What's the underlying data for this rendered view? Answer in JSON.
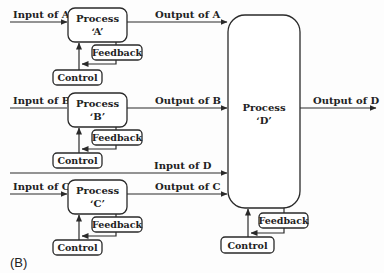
{
  "diagram": {
    "caption": "(B)",
    "processes": [
      {
        "id": "A",
        "title": "Process",
        "name": "‘A’",
        "input": "Input of A",
        "output": "Output of A",
        "feedback": "Feedback",
        "control": "Control"
      },
      {
        "id": "B",
        "title": "Process",
        "name": "‘B’",
        "input": "Input of B",
        "output": "Output of B",
        "feedback": "Feedback",
        "control": "Control"
      },
      {
        "id": "C",
        "title": "Process",
        "name": "‘C’",
        "input": "Input of C",
        "output": "Output of C",
        "feedback": "Feedback",
        "control": "Control"
      }
    ],
    "process_d": {
      "title": "Process",
      "name": "‘D’",
      "input": "Input of D",
      "output": "Output of D",
      "feedback": "Feedback",
      "control": "Control"
    },
    "colors": {
      "stroke": "#2a2a2a",
      "background": "#fdfdfd",
      "text": "#222222"
    }
  }
}
